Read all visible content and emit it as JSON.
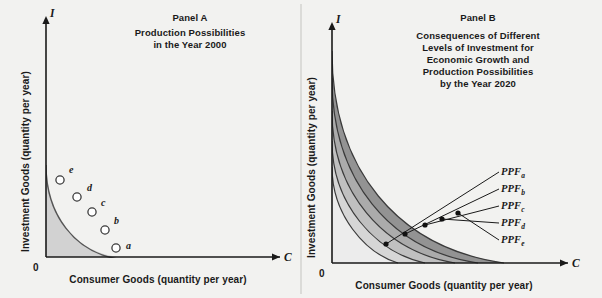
{
  "figure": {
    "background_color": "#f2f2f0",
    "ink_color": "#1a1a1a",
    "divider_color": "#b5b5b0"
  },
  "panel_a": {
    "title": "Panel A",
    "subtitle_line1": "Production Possibilities",
    "subtitle_line2": "in the Year 2000",
    "y_axis_letter": "I",
    "x_axis_letter": "C",
    "origin_label": "0",
    "y_axis_label": "Investment Goods (quantity per year)",
    "x_axis_label": "Consumer Goods (quantity per year)",
    "fill_color": "#d2d2d2",
    "curve_color": "#4a4a4a",
    "points": [
      {
        "label": "e",
        "x": 60,
        "y": 180
      },
      {
        "label": "d",
        "x": 77,
        "y": 197
      },
      {
        "label": "c",
        "x": 92,
        "y": 212
      },
      {
        "label": "b",
        "x": 105,
        "y": 230
      },
      {
        "label": "a",
        "x": 116,
        "y": 248
      }
    ]
  },
  "panel_b": {
    "title": "Panel B",
    "subtitle_line1": "Consequences of Different",
    "subtitle_line2": "Levels of Investment for",
    "subtitle_line3": "Economic Growth and",
    "subtitle_line4": "Production Possibilities",
    "subtitle_line5": "by the Year 2020",
    "y_axis_letter": "I",
    "x_axis_letter": "C",
    "origin_label": "0",
    "y_axis_label": "Investment Goods (quantity per year)",
    "x_axis_label": "Consumer Goods (quantity per year)",
    "curve_color": "#333333",
    "band_colors": [
      "#ececec",
      "#d6d6d6",
      "#c0c0c0",
      "#aaaaaa",
      "#949494"
    ],
    "curves": [
      {
        "label": "PPF",
        "sub": "a",
        "y_intercept": 51,
        "x_intercept": 504,
        "dot_x": 386,
        "dot_y": 244
      },
      {
        "label": "PPF",
        "sub": "b",
        "y_intercept": 78,
        "x_intercept": 478,
        "dot_x": 405,
        "dot_y": 234
      },
      {
        "label": "PPF",
        "sub": "c",
        "y_intercept": 111,
        "x_intercept": 455,
        "dot_x": 425,
        "dot_y": 225
      },
      {
        "label": "PPF",
        "sub": "d",
        "y_intercept": 141,
        "x_intercept": 425,
        "dot_x": 442,
        "dot_y": 219
      },
      {
        "label": "PPF",
        "sub": "e",
        "y_intercept": 167,
        "x_intercept": 398,
        "dot_x": 458,
        "dot_y": 213
      }
    ],
    "label_positions": [
      {
        "x": 504,
        "y": 176
      },
      {
        "x": 504,
        "y": 192
      },
      {
        "x": 504,
        "y": 209
      },
      {
        "x": 504,
        "y": 226
      },
      {
        "x": 504,
        "y": 243
      }
    ]
  }
}
